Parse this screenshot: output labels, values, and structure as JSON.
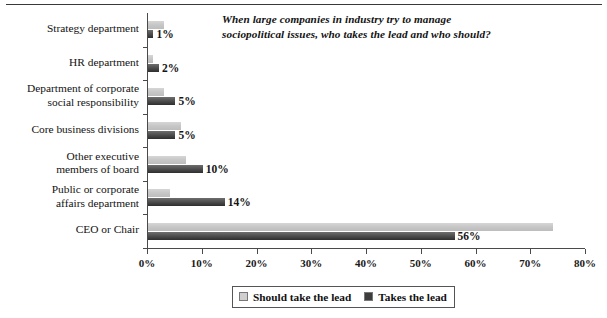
{
  "chart_data": {
    "type": "bar",
    "orientation": "horizontal",
    "title": "When large companies in industry try to manage sociopolitical issues, who takes the lead and who should?",
    "title_lines": [
      "When large companies in industry try to manage",
      "sociopolitical issues, who takes the lead and who should?"
    ],
    "xlabel": "",
    "ylabel": "",
    "xlim": [
      0,
      80
    ],
    "xticks": [
      0,
      10,
      20,
      30,
      40,
      50,
      60,
      70,
      80
    ],
    "xticklabels": [
      "0%",
      "10%",
      "20%",
      "30%",
      "40%",
      "50%",
      "60%",
      "70%",
      "80%"
    ],
    "grid": false,
    "legend_position": "bottom-center",
    "categories": [
      "Strategy department",
      "HR department",
      "Department of corporate\nsocial responsibility",
      "Core business divisions",
      "Other executive\nmembers of board",
      "Public or corporate\naffairs department",
      "CEO or Chair"
    ],
    "series": [
      {
        "name": "Should take the lead",
        "color": "#c6c6c6",
        "values": [
          3,
          1,
          3,
          6,
          7,
          4,
          74
        ],
        "labels": [
          "",
          "",
          "",
          "",
          "",
          "",
          ""
        ]
      },
      {
        "name": "Takes the lead",
        "color": "#3d3d3d",
        "values": [
          1,
          2,
          5,
          5,
          10,
          14,
          56
        ],
        "labels": [
          "1%",
          "2%",
          "5%",
          "5%",
          "10%",
          "14%",
          "56%"
        ]
      }
    ]
  },
  "legend": {
    "items": [
      {
        "label": "Should take the lead",
        "swatch": "light"
      },
      {
        "label": "Takes the lead",
        "swatch": "dark"
      }
    ]
  }
}
